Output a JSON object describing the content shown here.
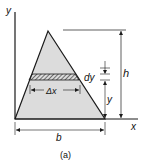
{
  "figure": {
    "caption": "(a)",
    "labels": {
      "y_axis": "y",
      "x_axis": "x",
      "height": "h",
      "strip_height": "dy",
      "strip_width": "Δx",
      "strip_position": "y",
      "base": "b"
    },
    "colors": {
      "triangle_fill": "#dcdcdc",
      "stroke": "#1a1a1a",
      "background": "#ffffff"
    }
  }
}
